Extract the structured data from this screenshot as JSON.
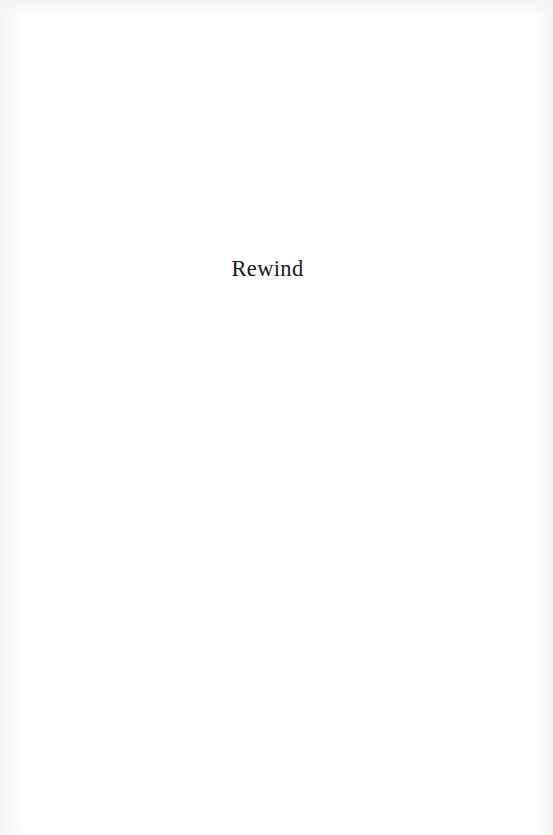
{
  "page": {
    "kind": "book-section-divider-page",
    "background_color": "#fefefe",
    "ink_color": "#1a1a1a",
    "width": 553,
    "height": 835
  },
  "content": {
    "section_title": "Rewind"
  }
}
